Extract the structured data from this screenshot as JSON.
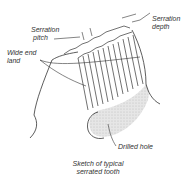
{
  "figure": {
    "caption_line1": "Sketch of typical",
    "caption_line2": "serrated tooth"
  },
  "labels": {
    "serration_pitch_line1": "Serration",
    "serration_pitch_line2": "pitch",
    "serration_depth_line1": "Serration",
    "serration_depth_line2": "depth",
    "wide_end_land_line1": "Wide end",
    "wide_end_land_line2": "land",
    "drilled_hole": "Drilled hole"
  },
  "colors": {
    "line": "#333333",
    "shading": "#d8d8d8",
    "background": "#ffffff"
  }
}
